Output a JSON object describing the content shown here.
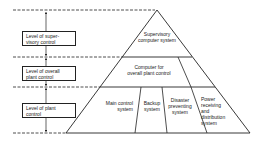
{
  "diagram": {
    "type": "control-hierarchy-pyramid",
    "colors": {
      "line": "#222222",
      "background": "#ffffff"
    },
    "levels": [
      {
        "id": "supervisory",
        "label": "Level of super-\nvisory control"
      },
      {
        "id": "overall",
        "label": "Level of overall\nplant control"
      },
      {
        "id": "plant",
        "label": "Level of plant\ncontrol"
      }
    ],
    "pyramid": {
      "top": {
        "label": "Supervisory\ncomputer system"
      },
      "middle": {
        "label": "Computer for\noverall plant control"
      },
      "bottom": [
        {
          "label": "Main control\nsystem"
        },
        {
          "label": "Backup\nsystem"
        },
        {
          "label": "Disaster\npreventing\nsystem"
        },
        {
          "label": "Power\nreceiving\nand\ndistribution\nsystem"
        }
      ]
    }
  }
}
